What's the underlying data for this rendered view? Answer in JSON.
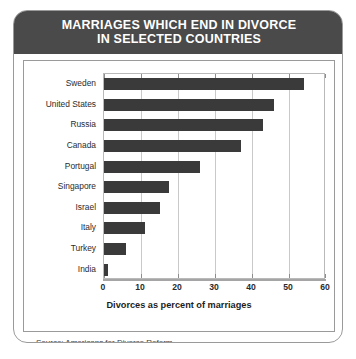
{
  "header": {
    "title_line1": "MARRIAGES WHICH END IN DIVORCE",
    "title_line2": "IN SELECTED COUNTRIES"
  },
  "source": "Source: Americans for Divorce Reform",
  "colors": {
    "header_band": "#4a4a4a",
    "bar": "#3a3a3a",
    "gridline": "#c9c9c9",
    "frame_border": "#9a9a9a"
  },
  "chart_data": {
    "type": "bar",
    "orientation": "horizontal",
    "title": "MARRIAGES WHICH END IN DIVORCE IN SELECTED COUNTRIES",
    "categories": [
      "Sweden",
      "United States",
      "Russia",
      "Canada",
      "Portugal",
      "Singapore",
      "Israel",
      "Italy",
      "Turkey",
      "India"
    ],
    "values": [
      54,
      46,
      43,
      37,
      26,
      17.5,
      15,
      11,
      6,
      1
    ],
    "xlabel": "Divorces as percent of marriages",
    "ylabel": "",
    "xlim": [
      0,
      60
    ],
    "xticks": [
      0,
      10,
      20,
      30,
      40,
      50,
      60
    ],
    "grid": true,
    "legend": null
  }
}
